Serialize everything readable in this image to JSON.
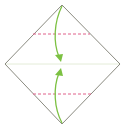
{
  "diagram": {
    "type": "origami-fold-step",
    "paper": {
      "shape": "diamond",
      "vertices": {
        "top": [
          62,
          5
        ],
        "right": [
          120,
          64
        ],
        "bottom": [
          62,
          124
        ],
        "left": [
          5,
          64
        ]
      },
      "edge_color": "#8a8a80"
    },
    "center_crease": {
      "y": 64,
      "color": "#e4ecd8",
      "style": "solid-faint"
    },
    "fold_lines": [
      {
        "name": "upper-valley-fold",
        "y": 34,
        "x1": 33,
        "x2": 90,
        "color": "#e0608a",
        "style": "dashed"
      },
      {
        "name": "lower-valley-fold",
        "y": 94,
        "x1": 33,
        "x2": 92,
        "color": "#e0608a",
        "style": "dashed"
      }
    ],
    "arrows": [
      {
        "name": "top-fold-arrow",
        "from": "top",
        "to": "center",
        "color": "#7cc142"
      },
      {
        "name": "bottom-fold-arrow",
        "from": "bottom",
        "to": "center",
        "color": "#7cc142"
      }
    ]
  }
}
